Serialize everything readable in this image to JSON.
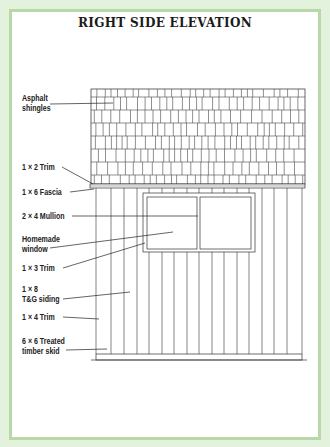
{
  "title": "RIGHT SIDE ELEVATION",
  "colors": {
    "background": "#e3f2dc",
    "frame_border": "#b8d8a8",
    "panel": "#ffffff",
    "line": "#333333"
  },
  "callouts": [
    {
      "id": "asphalt-shingles",
      "line1": "Asphalt",
      "line2": "shingles"
    },
    {
      "id": "trim-1x2",
      "line1": "1 × 2 Trim"
    },
    {
      "id": "fascia-1x6",
      "line1": "1 × 6 Fascia"
    },
    {
      "id": "mullion-2x4",
      "line1": "2 × 4 Mullion"
    },
    {
      "id": "homemade-window",
      "line1": "Homemade",
      "line2": "window"
    },
    {
      "id": "trim-1x3",
      "line1": "1 × 3 Trim"
    },
    {
      "id": "siding-1x8",
      "line1": "1 × 8",
      "line2": "T&G siding"
    },
    {
      "id": "trim-1x4",
      "line1": "1 × 4 Trim"
    },
    {
      "id": "skid-6x6",
      "line1": "6 × 6 Treated",
      "line2": "timber skid"
    }
  ]
}
